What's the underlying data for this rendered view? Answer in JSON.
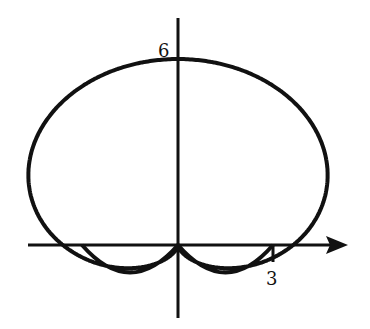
{
  "figure": {
    "type": "polar curve",
    "equation_hint": "r = 3 + 3 sin(theta)",
    "labels": {
      "y_intercept": "6",
      "x_intercept": "3"
    },
    "axes": {
      "x_axis_arrow": true,
      "y_axis_arrow": false
    },
    "stroke_color": "#111111",
    "background_color": "#ffffff"
  }
}
